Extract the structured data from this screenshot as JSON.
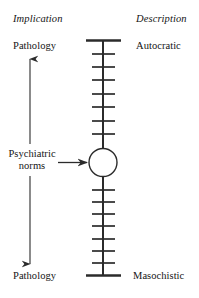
{
  "figure": {
    "headers": {
      "left": "Implication",
      "right": "Description"
    },
    "left_column": {
      "top_label": "Pathology",
      "middle_label_line1": "Psychiatric",
      "middle_label_line2": "norms",
      "bottom_label": "Pathology"
    },
    "right_column": {
      "top_label": "Autocratic",
      "bottom_label": "Masochistic"
    },
    "scale": {
      "tick_count_above_marker": 7,
      "tick_count_below_marker": 7,
      "marker_shape": "circle",
      "axis_color": "#2b2b2b",
      "top_cap": "horizontal-bar",
      "bottom_cap": "horizontal-bar"
    },
    "arrows": {
      "vertical_range_arrow": "double-headed",
      "pointer_arrow": "right-pointing"
    }
  }
}
